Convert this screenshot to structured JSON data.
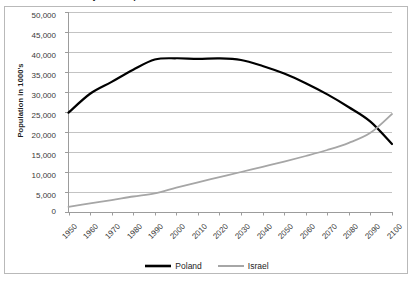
{
  "chart_data": {
    "type": "line",
    "title": "Projected Population Growth of Poland and Israel 1950-2100",
    "xlabel": "",
    "ylabel": "Population in 1000's",
    "ylim": [
      0,
      50000
    ],
    "ytick_step": 5000,
    "ytick_labels": [
      "50,000",
      "45,000",
      "40,000",
      "35,000",
      "30,000",
      "25,000",
      "20,000",
      "15,000",
      "10,000",
      "5,000",
      "0"
    ],
    "xlim": [
      1950,
      2100
    ],
    "x": [
      1950,
      1960,
      1970,
      1980,
      1990,
      2000,
      2010,
      2020,
      2030,
      2040,
      2050,
      2060,
      2070,
      2080,
      2090,
      2100
    ],
    "xtick_labels": [
      "1950",
      "1960",
      "1970",
      "1980",
      "1990",
      "2000",
      "2010",
      "2020",
      "2030",
      "2040",
      "2050",
      "2060",
      "2070",
      "2080",
      "2090",
      "2100"
    ],
    "grid": "horizontal",
    "legend_position": "bottom",
    "series": [
      {
        "name": "Poland",
        "color": "#000000",
        "width": 2.2,
        "values": [
          24824,
          29561,
          32526,
          35578,
          38119,
          38433,
          38277,
          38400,
          38000,
          36500,
          34600,
          32200,
          29400,
          26200,
          22600,
          17000
        ]
      },
      {
        "name": "Israel",
        "color": "#a6a6a6",
        "width": 1.8,
        "values": [
          1286,
          2141,
          2974,
          3878,
          4660,
          6084,
          7418,
          8700,
          10000,
          11300,
          12600,
          14000,
          15500,
          17300,
          19800,
          24500
        ]
      }
    ],
    "annotations": [
      {
        "text": "crossover",
        "x": 2087,
        "y": 20000
      }
    ]
  },
  "legend": {
    "items": [
      {
        "label": "Poland"
      },
      {
        "label": "Israel"
      }
    ]
  }
}
